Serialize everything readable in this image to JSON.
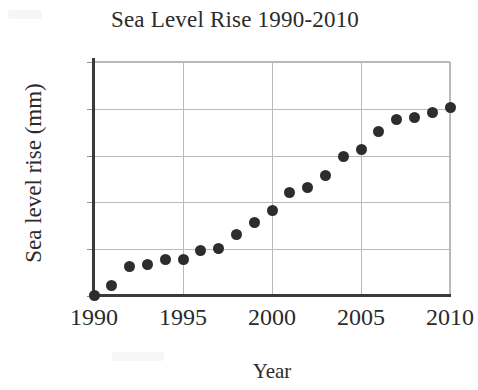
{
  "chart_data": {
    "type": "scatter",
    "title": "Sea Level Rise 1990-2010",
    "xlabel": "Year",
    "ylabel": "Sea level rise (mm)",
    "xlim": [
      1990,
      2010
    ],
    "ylim": [
      0,
      50
    ],
    "grid": true,
    "legend": "none",
    "marker": "filled-circle",
    "marker_color": "#2d2d2d",
    "gridline_color": "#b9b9b9",
    "axis_color": "#3a3a3a",
    "x_tick_labels": [
      "1990",
      "1995",
      "2000",
      "2005",
      "2010"
    ],
    "x_tick_values": [
      1990,
      1995,
      2000,
      2005,
      2010
    ],
    "y_tick_labels": [
      "0",
      "10",
      "20",
      "30",
      "40",
      "50"
    ],
    "y_tick_values": [
      0,
      10,
      20,
      30,
      40,
      50
    ],
    "x": [
      1990,
      1991,
      1992,
      1993,
      1994,
      1995,
      1996,
      1997,
      1998,
      1999,
      2000,
      2001,
      2002,
      2003,
      2004,
      2005,
      2006,
      2007,
      2008,
      2009,
      2010
    ],
    "values": [
      0,
      2,
      6,
      6.5,
      7.5,
      7.5,
      9.5,
      10,
      13,
      15.5,
      18,
      22,
      23,
      25.5,
      29.5,
      31,
      35,
      37.5,
      38,
      39,
      40
    ],
    "points": [
      {
        "x": 1990,
        "y": 0
      },
      {
        "x": 1991,
        "y": 2
      },
      {
        "x": 1992,
        "y": 6
      },
      {
        "x": 1993,
        "y": 6.5
      },
      {
        "x": 1994,
        "y": 7.5
      },
      {
        "x": 1995,
        "y": 7.5
      },
      {
        "x": 1996,
        "y": 9.5
      },
      {
        "x": 1997,
        "y": 10
      },
      {
        "x": 1998,
        "y": 13
      },
      {
        "x": 1999,
        "y": 15.5
      },
      {
        "x": 2000,
        "y": 18
      },
      {
        "x": 2001,
        "y": 22
      },
      {
        "x": 2002,
        "y": 23
      },
      {
        "x": 2003,
        "y": 25.5
      },
      {
        "x": 2004,
        "y": 29.5
      },
      {
        "x": 2005,
        "y": 31
      },
      {
        "x": 2006,
        "y": 35
      },
      {
        "x": 2007,
        "y": 37.5
      },
      {
        "x": 2008,
        "y": 38
      },
      {
        "x": 2009,
        "y": 39
      },
      {
        "x": 2010,
        "y": 40
      }
    ]
  }
}
